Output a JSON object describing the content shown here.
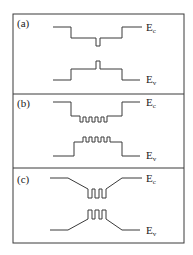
{
  "figure": {
    "frame": {
      "x": 13,
      "y": 14,
      "width": 171,
      "height": 229
    },
    "dividers": [
      94,
      168
    ],
    "stroke_color": "#3a3a3a",
    "panels": [
      {
        "label": "(a)",
        "label_pos": [
          17,
          27
        ],
        "conduction_band": {
          "label": "E",
          "sub": "c",
          "label_pos": [
            146,
            31
          ],
          "points": "53,27 71,27 71,38 96,38 96,46 100,46 100,38 122,38 122,27 142,27"
        },
        "valence_band": {
          "label": "E",
          "sub": "v",
          "label_pos": [
            146,
            83
          ],
          "points": "53,80 71,80 71,69 96,69 96,61 100,61 100,69 122,69 122,80 140,80"
        }
      },
      {
        "label": "(b)",
        "label_pos": [
          17,
          107
        ],
        "conduction_band": {
          "label": "E",
          "sub": "c",
          "label_pos": [
            146,
            106
          ],
          "points": "53,102 71,102 71,116 80,116 80,122 83,122 83,117 86,117 86,122 89,122 89,117 92,117 92,122 95,122 95,117 98,117 98,122 101,122 101,117 104,117 104,122 107,122 107,116 122,116 122,102 140,102"
        },
        "valence_band": {
          "label": "E",
          "sub": "v",
          "label_pos": [
            146,
            159
          ],
          "points": "53,156 74,156 74,142 83,142 83,137 86,137 86,142 89,142 89,137 92,137 92,142 95,142 95,137 98,137 98,142 101,142 101,137 104,137 104,142 107,142 107,137 110,137 110,142 122,142 122,156 140,156"
        }
      },
      {
        "label": "(c)",
        "label_pos": [
          17,
          183
        ],
        "conduction_band": {
          "label": "E",
          "sub": "c",
          "label_pos": [
            146,
            182
          ],
          "points": "50,178 68,178 88,189 88,198 92,198 92,189 95,189 95,198 99,198 99,189 102,189 102,198 106,198 106,189 122,178 142,178"
        },
        "valence_band": {
          "label": "E",
          "sub": "v",
          "label_pos": [
            146,
            234
          ],
          "points": "50,230 68,230 88,219 88,210 92,210 92,219 95,219 95,210 99,210 99,219 102,219 102,210 106,210 106,219 122,230 140,230"
        }
      }
    ]
  }
}
